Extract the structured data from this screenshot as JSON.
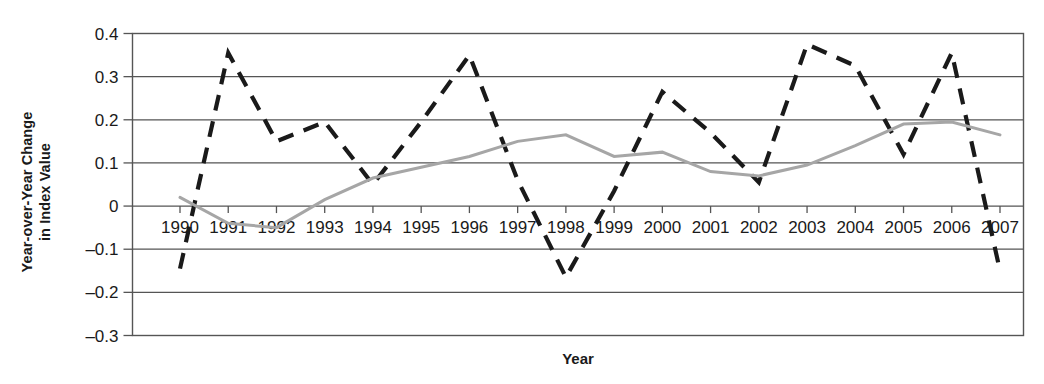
{
  "chart_data": {
    "type": "line",
    "title": "",
    "xlabel": "Year",
    "ylabel_line1": "Year-over-Year Change",
    "ylabel_line2": "in Index Value",
    "ylabel": "Year-over-Year Change in Index Value",
    "grid": "horizontal",
    "legend_position": "none",
    "xlim": [
      1990,
      2007
    ],
    "ylim": [
      -0.3,
      0.4
    ],
    "ytick_labels": [
      "0.4",
      "0.3",
      "0.2",
      "0.1",
      "0",
      "–0.1",
      "–0.2",
      "–0.3"
    ],
    "ytick_values": [
      0.4,
      0.3,
      0.2,
      0.1,
      0,
      -0.1,
      -0.2,
      -0.3
    ],
    "xtick_labels": [
      "1990",
      "1991",
      "1992",
      "1993",
      "1994",
      "1995",
      "1996",
      "1997",
      "1998",
      "1999",
      "2000",
      "2001",
      "2002",
      "2003",
      "2004",
      "2005",
      "2006",
      "2007"
    ],
    "categories": [
      1990,
      1991,
      1992,
      1993,
      1994,
      1995,
      1996,
      1997,
      1998,
      1999,
      2000,
      2001,
      2002,
      2003,
      2004,
      2005,
      2006,
      2007
    ],
    "series": [
      {
        "name": "dashed-series",
        "style": "dashed",
        "color": "#1a1a1a",
        "values": [
          -0.145,
          0.355,
          0.15,
          0.195,
          0.05,
          0.195,
          0.35,
          0.06,
          -0.165,
          0.035,
          0.265,
          0.17,
          0.055,
          0.375,
          0.325,
          0.12,
          0.355,
          -0.15
        ]
      },
      {
        "name": "solid-gray-series",
        "style": "solid",
        "color": "#a6a6a6",
        "values": [
          0.02,
          -0.04,
          -0.05,
          0.015,
          0.065,
          0.09,
          0.115,
          0.15,
          0.165,
          0.115,
          0.125,
          0.08,
          0.07,
          0.095,
          0.14,
          0.19,
          0.195,
          0.165
        ]
      }
    ]
  },
  "axes": {
    "x_axis_title": "Year",
    "y_axis_title_line1": "Year-over-Year Change",
    "y_axis_title_line2": "in Index Value"
  },
  "colors": {
    "dashed_series": "#1a1a1a",
    "solid_series": "#a6a6a6",
    "grid": "#555555",
    "border": "#555555",
    "text": "#1a1a1a",
    "background": "#ffffff"
  }
}
